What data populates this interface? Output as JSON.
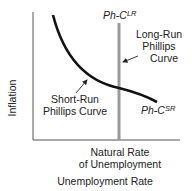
{
  "diagram": {
    "axes": {
      "y_label": "Inflation",
      "x_label": "Unemployment Rate",
      "x_marker_label_line1": "Natural Rate",
      "x_marker_label_line2": "of Unemployment"
    },
    "long_run": {
      "label_prefix": "Ph-C",
      "label_sup": "LR",
      "annotation_line1": "Long-Run",
      "annotation_line2": "Phillips",
      "annotation_line3": "Curve",
      "color": "#9a9a9a"
    },
    "short_run": {
      "label_prefix": "Ph-C",
      "label_sup": "SR",
      "annotation_line1": "Short-Run",
      "annotation_line2": "Phillips Curve",
      "color": "#111111"
    }
  }
}
